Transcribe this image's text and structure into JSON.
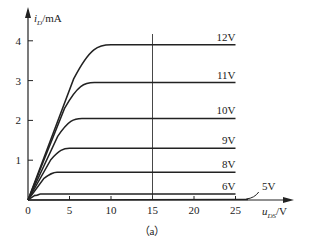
{
  "chart_data": {
    "type": "line",
    "title": "",
    "caption": "（a）",
    "xlabel": "u_DS/V",
    "ylabel": "i_D/mA",
    "xlim": [
      0,
      28
    ],
    "ylim": [
      0,
      4.5
    ],
    "x_ticks": [
      0,
      5,
      10,
      15,
      20,
      25
    ],
    "y_ticks": [
      1,
      2,
      3,
      4
    ],
    "grid": false,
    "legend_position": "inline-right",
    "annotations": [
      {
        "type": "vertical-line",
        "x": 15
      }
    ],
    "series": [
      {
        "name": "12V",
        "saturation_mA": 3.9,
        "knee_V": 10
      },
      {
        "name": "11V",
        "saturation_mA": 2.95,
        "knee_V": 8
      },
      {
        "name": "10V",
        "saturation_mA": 2.05,
        "knee_V": 6.5
      },
      {
        "name": "9V",
        "saturation_mA": 1.3,
        "knee_V": 5
      },
      {
        "name": "8V",
        "saturation_mA": 0.7,
        "knee_V": 3.5
      },
      {
        "name": "6V",
        "saturation_mA": 0.15,
        "knee_V": 1.5
      },
      {
        "name": "5V",
        "saturation_mA": 0.0,
        "knee_V": 0
      }
    ]
  },
  "labels": {
    "y_unit_main": "i",
    "y_unit_sub": "D",
    "y_unit_rest": "/mA",
    "x_unit_main": "u",
    "x_unit_sub": "DS",
    "x_unit_rest": "/V",
    "origin": "0",
    "caption": "（a）"
  }
}
